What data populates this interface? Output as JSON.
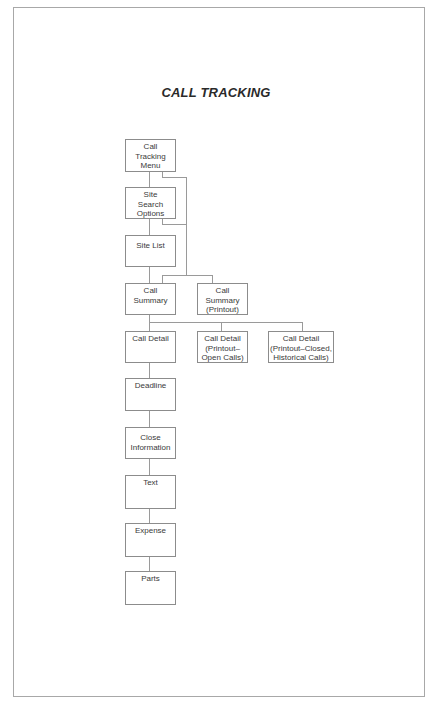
{
  "title": "CALL TRACKING",
  "nodes": {
    "call_tracking_menu": "Call\nTracking\nMenu",
    "site_search_options": "Site\nSearch\nOptions",
    "site_list": "Site List",
    "call_summary": "Call\nSummary",
    "call_summary_printout": "Call\nSummary\n(Printout)",
    "call_detail": "Call Detail",
    "call_detail_printout_open": "Call Detail\n(Printout–\nOpen Calls)",
    "call_detail_printout_closed": "Call Detail\n(Printout–Closed,\nHistorical Calls)",
    "deadline": "Deadline",
    "close_information": "Close\nInformation",
    "text": "Text",
    "expense": "Expense",
    "parts": "Parts"
  },
  "edges": [
    [
      "call_tracking_menu",
      "site_search_options"
    ],
    [
      "call_tracking_menu",
      "call_summary"
    ],
    [
      "site_search_options",
      "site_list"
    ],
    [
      "site_search_options",
      "call_summary"
    ],
    [
      "site_list",
      "call_summary"
    ],
    [
      "call_summary",
      "call_summary_printout"
    ],
    [
      "call_summary",
      "call_detail"
    ],
    [
      "call_summary",
      "call_detail_printout_open"
    ],
    [
      "call_summary",
      "call_detail_printout_closed"
    ],
    [
      "call_detail",
      "deadline"
    ],
    [
      "deadline",
      "close_information"
    ],
    [
      "close_information",
      "text"
    ],
    [
      "text",
      "expense"
    ],
    [
      "expense",
      "parts"
    ]
  ],
  "colors": {
    "border": "#8c8c8c",
    "line": "#9a9a9a",
    "text": "#3a3a3a",
    "frame": "#a8a8a8"
  }
}
